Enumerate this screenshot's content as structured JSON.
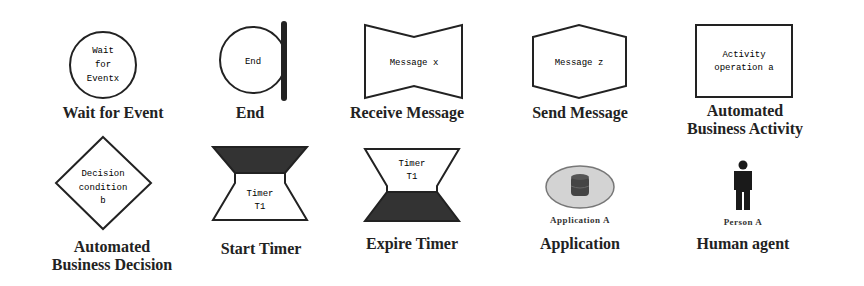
{
  "symbols": [
    {
      "caption": "Wait for Event",
      "inner": [
        "Wait",
        "for",
        "Eventx"
      ]
    },
    {
      "caption": "End",
      "inner": [
        "End"
      ]
    },
    {
      "caption": "Receive Message",
      "inner": [
        "Message x"
      ]
    },
    {
      "caption": "Send Message",
      "inner": [
        "Message z"
      ]
    },
    {
      "caption_lines": [
        "Automated",
        "Business Activity"
      ],
      "inner": [
        "Activity",
        "operation a"
      ]
    },
    {
      "caption_lines": [
        "Automated",
        "Business Decision"
      ],
      "inner": [
        "Decision",
        "condition",
        "b"
      ]
    },
    {
      "caption": "Start Timer",
      "inner": [
        "Timer",
        "T1"
      ]
    },
    {
      "caption": "Expire Timer",
      "inner": [
        "Timer",
        "T1"
      ]
    },
    {
      "caption": "Application",
      "sublabel": "Application A"
    },
    {
      "caption": "Human agent",
      "sublabel": "Person A"
    }
  ],
  "colors": {
    "stroke": "#222222",
    "fill_dark": "#333333",
    "app_ellipse": "#d3d3d3",
    "app_db": "#444444"
  }
}
